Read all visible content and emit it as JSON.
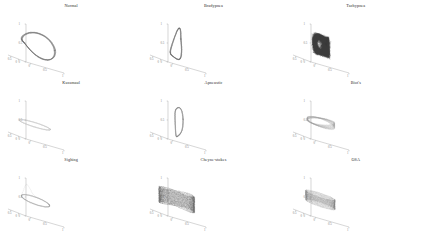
{
  "figure": {
    "background": "#ffffff",
    "axis_color": "#9a9a9a",
    "title_color": "#2b2b2b"
  },
  "chart_data": {
    "type": "line",
    "title": "",
    "xlabel": "",
    "ylabel": "",
    "zlabel": "",
    "projection": "3d",
    "grid": false,
    "legend": false,
    "axis_ranges": {
      "x": [
        -0.5,
        1
      ],
      "y": [
        -0.5,
        1
      ],
      "z": [
        0,
        1
      ]
    },
    "shared_x_ticks": [
      "0.5",
      "0",
      "0",
      "0.5",
      "1"
    ],
    "shared_z_ticks": [
      "1",
      "0.5",
      "0"
    ],
    "panels": [
      {
        "index": 0,
        "title": "Normal",
        "row": 0,
        "col": 0,
        "attractor_shape": "teardrop-loop",
        "stroke": "#6e6e6e",
        "density": "medium",
        "n_orbits": 14,
        "x_ticks": [
          "0.5",
          "0",
          "0",
          "0.5",
          "1"
        ],
        "z_ticks": [
          "1",
          "0.5",
          "0"
        ]
      },
      {
        "index": 1,
        "title": "Bradypnea",
        "row": 0,
        "col": 1,
        "attractor_shape": "vertical-bulb-loop",
        "stroke": "#6e6e6e",
        "density": "medium",
        "n_orbits": 12,
        "x_ticks": [
          "0.5",
          "0",
          "0",
          "0.5",
          "1"
        ],
        "z_ticks": [
          "1",
          "0.5",
          "0"
        ]
      },
      {
        "index": 2,
        "title": "Tachypnea",
        "row": 0,
        "col": 2,
        "attractor_shape": "dense-tangle",
        "stroke": "#3a3a3a",
        "density": "very-high",
        "n_orbits": 40,
        "x_ticks": [
          "0.5",
          "0",
          "0",
          "0.5",
          "1"
        ],
        "z_ticks": [
          "1",
          "0.5",
          "0"
        ]
      },
      {
        "index": 3,
        "title": "Kussmaul",
        "row": 1,
        "col": 0,
        "attractor_shape": "flat-thin-spindle",
        "stroke": "#c2c2c2",
        "density": "low",
        "n_orbits": 10,
        "x_ticks": [
          "0.5",
          "0",
          "0",
          "0.5",
          "1"
        ],
        "z_ticks": [
          "1",
          "0.5",
          "0"
        ]
      },
      {
        "index": 4,
        "title": "Apneustic",
        "row": 1,
        "col": 1,
        "attractor_shape": "tall-ribbon-loop",
        "stroke": "#8a8a8a",
        "density": "medium",
        "n_orbits": 11,
        "x_ticks": [
          "0.5",
          "0",
          "0",
          "0.5",
          "1"
        ],
        "z_ticks": [
          "1",
          "0.5",
          "0"
        ]
      },
      {
        "index": 5,
        "title": "Biot's",
        "row": 1,
        "col": 2,
        "attractor_shape": "flat-elliptical-rings",
        "stroke": "#9e9e9e",
        "density": "medium",
        "n_orbits": 16,
        "x_ticks": [
          "0.5",
          "0",
          "0",
          "0.5",
          "1"
        ],
        "z_ticks": [
          "1",
          "0.5",
          "0"
        ]
      },
      {
        "index": 6,
        "title": "Sighing",
        "row": 2,
        "col": 0,
        "attractor_shape": "flat-loop-with-spike",
        "stroke": "#9a9a9a",
        "density": "low",
        "n_orbits": 9,
        "x_ticks": [
          "0.5",
          "0",
          "0",
          "0.5",
          "1"
        ],
        "z_ticks": [
          "1",
          "0.5",
          "0"
        ]
      },
      {
        "index": 7,
        "title": "Cheyne-stokes",
        "row": 2,
        "col": 1,
        "attractor_shape": "stratified-horizontal-bands",
        "stroke": "#5d5d5d",
        "density": "high",
        "n_orbits": 26,
        "x_ticks": [
          "0.5",
          "0",
          "0",
          "0.5",
          "1"
        ],
        "z_ticks": [
          "1",
          "0.5",
          "0"
        ]
      },
      {
        "index": 8,
        "title": "OSA",
        "row": 2,
        "col": 2,
        "attractor_shape": "flat-layered-loops",
        "stroke": "#7a7a7a",
        "density": "high",
        "n_orbits": 20,
        "x_ticks": [
          "0.5",
          "0",
          "0",
          "0.5",
          "1"
        ],
        "z_ticks": [
          "1",
          "0.5",
          "0"
        ]
      }
    ]
  }
}
